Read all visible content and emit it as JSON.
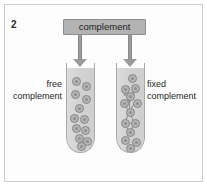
{
  "figure": {
    "panel_number": "2",
    "source_label": "complement",
    "left_label_line1": "free",
    "left_label_line2": "complement",
    "right_label_line1": "fixed",
    "right_label_line2": "complement",
    "colors": {
      "box_fill": "#b3b3b3",
      "box_border": "#8e8e8e",
      "arrow": "#9a9a9a",
      "tube_fill": "#d8d8d8",
      "tube_border": "#a8a8a8",
      "particle_fill": "#b5b5b5",
      "particle_border": "#868686",
      "frame_border": "#c9cdd1",
      "background": "#ffffff",
      "text": "#1d1d1d"
    }
  },
  "chart_data": {
    "type": "diagram",
    "title": "complement",
    "panel": "2",
    "arrows": [
      {
        "name": "arrow-to-left-tube",
        "from": "complement",
        "to": "free complement tube"
      },
      {
        "name": "arrow-to-right-tube",
        "from": "complement",
        "to": "fixed complement tube"
      }
    ],
    "tubes": [
      {
        "name": "free-complement-tube",
        "label": "free complement",
        "label_side": "left",
        "particle_count": 12,
        "lattice": false,
        "particles": [
          {
            "x": 5,
            "y": 9
          },
          {
            "x": 15,
            "y": 14
          },
          {
            "x": 4,
            "y": 22
          },
          {
            "x": 15,
            "y": 27
          },
          {
            "x": 8,
            "y": 36
          },
          {
            "x": 3,
            "y": 46
          },
          {
            "x": 13,
            "y": 47
          },
          {
            "x": 5,
            "y": 56
          },
          {
            "x": 14,
            "y": 58
          },
          {
            "x": 8,
            "y": 66
          },
          {
            "x": 16,
            "y": 69
          },
          {
            "x": 10,
            "y": 74
          }
        ]
      },
      {
        "name": "fixed-complement-tube",
        "label": "fixed complement",
        "label_side": "right",
        "particle_count": 13,
        "lattice": true,
        "particles": [
          {
            "x": 11,
            "y": 6
          },
          {
            "x": 4,
            "y": 17
          },
          {
            "x": 14,
            "y": 16
          },
          {
            "x": 3,
            "y": 31
          },
          {
            "x": 16,
            "y": 31
          },
          {
            "x": 9,
            "y": 24
          },
          {
            "x": 9,
            "y": 40
          },
          {
            "x": 4,
            "y": 51
          },
          {
            "x": 14,
            "y": 51
          },
          {
            "x": 9,
            "y": 60
          },
          {
            "x": 4,
            "y": 68
          },
          {
            "x": 15,
            "y": 70
          },
          {
            "x": 9,
            "y": 76
          }
        ],
        "links": [
          {
            "x1": 8,
            "y1": 20,
            "x2": 13,
            "y2": 20
          },
          {
            "x1": 7,
            "y1": 21,
            "x2": 13,
            "y2": 35
          },
          {
            "x1": 18,
            "y1": 21,
            "x2": 13,
            "y2": 35
          },
          {
            "x1": 7,
            "y1": 21,
            "x2": 8,
            "y2": 28
          },
          {
            "x1": 18,
            "y1": 21,
            "x2": 17,
            "y2": 28
          },
          {
            "x1": 13,
            "y1": 28,
            "x2": 13,
            "y2": 44
          },
          {
            "x1": 7,
            "y1": 35,
            "x2": 13,
            "y2": 44
          },
          {
            "x1": 18,
            "y1": 35,
            "x2": 13,
            "y2": 44
          },
          {
            "x1": 13,
            "y1": 44,
            "x2": 8,
            "y2": 55
          },
          {
            "x1": 13,
            "y1": 44,
            "x2": 18,
            "y2": 55
          },
          {
            "x1": 8,
            "y1": 55,
            "x2": 18,
            "y2": 55
          },
          {
            "x1": 8,
            "y1": 56,
            "x2": 13,
            "y2": 64
          },
          {
            "x1": 18,
            "y1": 56,
            "x2": 13,
            "y2": 64
          }
        ]
      }
    ]
  }
}
